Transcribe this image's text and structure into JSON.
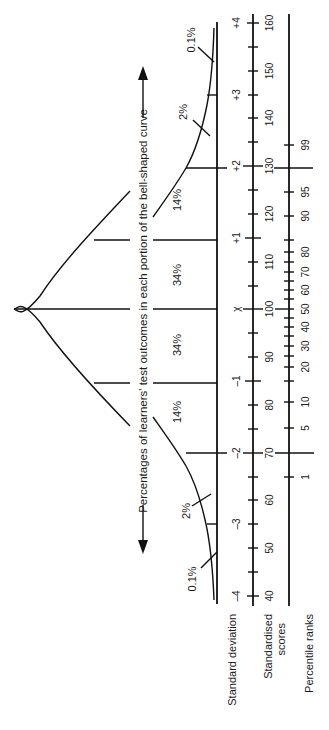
{
  "caption": "Percentages of learners' test outcomes in each portion of the bell-shaped curve",
  "region_percentages": {
    "left_tail": "0.1%",
    "left_2": "2%",
    "left_14": "14%",
    "left_34": "34%",
    "right_34": "34%",
    "right_14": "14%",
    "right_2": "2%",
    "right_tail": "0.1%"
  },
  "axes": {
    "standard_deviation": {
      "label": "Standard deviation",
      "ticks": [
        "-4",
        "-3",
        "-2",
        "-1",
        "x̄",
        "+1",
        "+2",
        "+3",
        "+4"
      ]
    },
    "standardised_scores": {
      "label_line1": "Standardised",
      "label_line2": "scores",
      "ticks": [
        "40",
        "50",
        "60",
        "70",
        "80",
        "90",
        "100",
        "110",
        "120",
        "130",
        "140",
        "150",
        "160"
      ]
    },
    "percentile_ranks": {
      "label": "Percentile ranks",
      "ticks": [
        "1",
        "5",
        "10",
        "20",
        "30",
        "40",
        "50",
        "60",
        "70",
        "80",
        "90",
        "95",
        "99"
      ]
    }
  },
  "labels": {
    "sd_m4": "–4",
    "sd_m3": "–3",
    "sd_m2": "–2",
    "sd_m1": "–1",
    "sd_mean": "χ",
    "sd_p1": "+1",
    "sd_p2": "+2",
    "sd_p3": "+3",
    "sd_p4": "+4",
    "s40": "40",
    "s50": "50",
    "s60": "60",
    "s70": "70",
    "s80": "80",
    "s90": "90",
    "s100": "100",
    "s110": "110",
    "s120": "120",
    "s130": "130",
    "s140": "140",
    "s150": "150",
    "s160": "160",
    "p1": "1",
    "p5": "5",
    "p10": "10",
    "p20": "20",
    "p30": "30",
    "p40": "40",
    "p50": "50",
    "p60": "60",
    "p70": "70",
    "p80": "80",
    "p90": "90",
    "p95": "95",
    "p99": "99"
  }
}
